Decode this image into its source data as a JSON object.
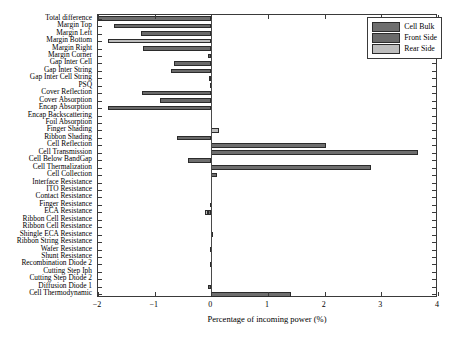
{
  "chart_data": {
    "type": "bar",
    "orientation": "horizontal",
    "title": "",
    "xlabel": "Percentage of incoming power (%)",
    "ylabel": "",
    "xlim": [
      -2,
      4
    ],
    "xticks": [
      -2,
      -1,
      0,
      1,
      2,
      3,
      4
    ],
    "xticklabels": [
      "−2",
      "−1",
      "0",
      "1",
      "2",
      "3",
      "4"
    ],
    "grid": false,
    "legend": {
      "position": "upper right",
      "entries": [
        {
          "label": "Cell Bulk",
          "color": "#6e6e6e"
        },
        {
          "label": "Front Side",
          "color": "#6a6a6a"
        },
        {
          "label": "Rear Side",
          "color": "#bdbdbd"
        }
      ]
    },
    "categories": [
      "Total difference",
      "Margin Top",
      "Margin Left",
      "Margin Bottom",
      "Margin Right",
      "Margin Corner",
      "Gap Inter Cell",
      "Gap Inter String",
      "Gap Inter Cell String",
      "PSQ",
      "Cover Reflection",
      "Cover Absorption",
      "Encap Absorption",
      "Encap Backscattering",
      "Foil Absorption",
      "Finger Shading",
      "Ribbon Shading",
      "Cell Reflection",
      "Cell Transmission",
      "Cell Below BandGap",
      "Cell Thermalization",
      "Cell Collection",
      "Interface Resistance",
      "ITO Resistance",
      "Contact Resistance",
      "Finger Resistance",
      "ECA Resistance",
      "Ribbon Cell Resistance",
      "Ribbon Cell Resistance",
      "Shingle ECA Resistance",
      "Ribbon String Resistance",
      "Wafer Resistance",
      "Shunt Resistance",
      "Recombination Diode 2",
      "Cutting Step Iph",
      "Cutting Step Diode 2",
      "Diffusion Diode 1",
      "Cell Thermodynamic"
    ],
    "series": [
      {
        "name": "Cell Bulk",
        "color": "#6e6e6e",
        "values": [
          -2.0,
          -1.71,
          -1.24,
          -1.83,
          -1.2,
          -0.06,
          -0.66,
          -0.71,
          -0.04,
          -0.03,
          -1.23,
          -0.9,
          -1.83,
          0.0,
          0.0,
          0.13,
          -0.6,
          2.03,
          3.65,
          -0.41,
          2.81,
          0.1,
          0.0,
          0.0,
          0.0,
          -0.02,
          -0.12,
          0.0,
          0.0,
          -0.01,
          0.0,
          -0.02,
          0.0,
          -0.03,
          0.0,
          0.0,
          -0.06,
          1.4
        ]
      }
    ],
    "bar_styles": [
      {
        "category": "Total difference",
        "value": -2.0,
        "group": "Cell Bulk",
        "note": "extends past left axis limit"
      },
      {
        "category": "Margin Top",
        "value": -1.71,
        "group": "Front Side"
      },
      {
        "category": "Margin Left",
        "value": -1.24,
        "group": "Front Side"
      },
      {
        "category": "Margin Bottom",
        "value": -1.83,
        "group": "Rear Side"
      },
      {
        "category": "Margin Right",
        "value": -1.2,
        "group": "Front Side"
      },
      {
        "category": "Margin Corner",
        "value": -0.06,
        "group": "Front Side"
      },
      {
        "category": "Gap Inter Cell",
        "value": -0.66,
        "group": "Front Side"
      },
      {
        "category": "Gap Inter String",
        "value": -0.71,
        "group": "Front Side"
      },
      {
        "category": "Gap Inter Cell String",
        "value": -0.04,
        "group": "Front Side"
      },
      {
        "category": "PSQ",
        "value": -0.03,
        "group": "Front Side"
      },
      {
        "category": "Cover Reflection",
        "value": -1.23,
        "group": "Front Side"
      },
      {
        "category": "Cover Absorption",
        "value": -0.9,
        "group": "Front Side"
      },
      {
        "category": "Encap Absorption",
        "value": -1.83,
        "group": "Front Side"
      },
      {
        "category": "Encap Backscattering",
        "value": 0.0,
        "group": "Front Side"
      },
      {
        "category": "Foil Absorption",
        "value": 0.0,
        "group": "Rear Side"
      },
      {
        "category": "Finger Shading",
        "value": 0.13,
        "group": "Rear Side"
      },
      {
        "category": "Ribbon Shading",
        "value": -0.6,
        "group": "Front Side"
      },
      {
        "category": "Cell Reflection",
        "value": 2.03,
        "group": "Cell Bulk"
      },
      {
        "category": "Cell Transmission",
        "value": 3.65,
        "group": "Cell Bulk"
      },
      {
        "category": "Cell Below BandGap",
        "value": -0.41,
        "group": "Cell Bulk"
      },
      {
        "category": "Cell Thermalization",
        "value": 2.81,
        "group": "Cell Bulk"
      },
      {
        "category": "Cell Collection",
        "value": 0.1,
        "group": "Cell Bulk"
      },
      {
        "category": "Interface Resistance",
        "value": 0.0,
        "group": "Cell Bulk"
      },
      {
        "category": "ITO Resistance",
        "value": 0.0,
        "group": "Cell Bulk"
      },
      {
        "category": "Contact Resistance",
        "value": 0.0,
        "group": "Cell Bulk"
      },
      {
        "category": "Finger Resistance",
        "value": -0.02,
        "group": "Cell Bulk"
      },
      {
        "category": "ECA Resistance",
        "value": -0.12,
        "group": "Rear Side"
      },
      {
        "category": "Ribbon Cell Resistance",
        "value": 0.0,
        "group": "Cell Bulk"
      },
      {
        "category": "Ribbon Cell Resistance",
        "value": 0.0,
        "group": "Cell Bulk"
      },
      {
        "category": "Shingle ECA Resistance",
        "value": -0.01,
        "group": "Cell Bulk"
      },
      {
        "category": "Ribbon String Resistance",
        "value": 0.0,
        "group": "Cell Bulk"
      },
      {
        "category": "Wafer Resistance",
        "value": -0.02,
        "group": "Cell Bulk"
      },
      {
        "category": "Shunt Resistance",
        "value": 0.0,
        "group": "Cell Bulk"
      },
      {
        "category": "Recombination Diode 2",
        "value": -0.03,
        "group": "Cell Bulk"
      },
      {
        "category": "Cutting Step Iph",
        "value": 0.0,
        "group": "Cell Bulk"
      },
      {
        "category": "Cutting Step Diode 2",
        "value": 0.0,
        "group": "Cell Bulk"
      },
      {
        "category": "Diffusion Diode 1",
        "value": -0.06,
        "group": "Cell Bulk"
      },
      {
        "category": "Cell Thermodynamic",
        "value": 1.4,
        "group": "Cell Bulk"
      }
    ]
  }
}
